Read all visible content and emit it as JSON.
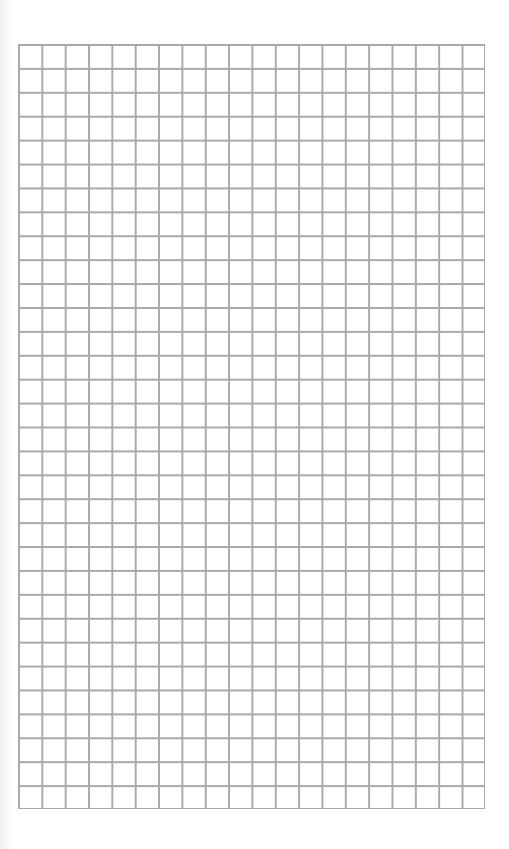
{
  "page": {
    "type": "graph-paper",
    "grid": {
      "columns": 20,
      "rows": 32,
      "line_color": "#a9a9a9",
      "background_color": "#ffffff"
    }
  }
}
